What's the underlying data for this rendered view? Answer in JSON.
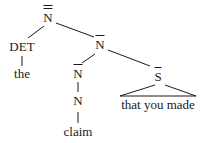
{
  "diagram": {
    "type": "syntax-tree",
    "nodes": {
      "root": {
        "label": "N",
        "bars": 2
      },
      "det": {
        "label": "DET"
      },
      "det_word": {
        "label": "the"
      },
      "nbar": {
        "label": "N",
        "bars": 1
      },
      "nbar_inner": {
        "label": "N",
        "bars": 1
      },
      "n": {
        "label": "N"
      },
      "n_word": {
        "label": "claim"
      },
      "sbar": {
        "label": "S",
        "bars": 1
      },
      "sbar_text": {
        "label": "that you made"
      }
    }
  }
}
